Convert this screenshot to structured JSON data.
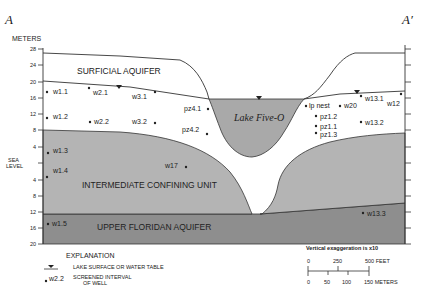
{
  "section": {
    "left_label": "A",
    "right_label": "A′"
  },
  "axis": {
    "title": "METERS",
    "ticks": [
      "28",
      "24",
      "20",
      "16",
      "12",
      "8",
      "4",
      "SEA",
      "4",
      "8",
      "12",
      "16",
      "20"
    ],
    "sea_level_line1": "SEA",
    "sea_level_line2": "LEVEL"
  },
  "units": {
    "surficial": "SURFICIAL AQUIFER",
    "confining": "INTERMEDIATE CONFINING UNIT",
    "floridan": "UPPER FLORIDAN AQUIFER",
    "lake": "Lake Five-O"
  },
  "wells": [
    {
      "id": "w1.1",
      "x": 47,
      "y": 92,
      "lx": 53,
      "ly": 94
    },
    {
      "id": "w1.2",
      "x": 47,
      "y": 118,
      "lx": 53,
      "ly": 119
    },
    {
      "id": "w1.3",
      "x": 48,
      "y": 153,
      "lx": 53,
      "ly": 153
    },
    {
      "id": "w1.4",
      "x": 47,
      "y": 177,
      "lx": 53,
      "ly": 173
    },
    {
      "id": "w1.5",
      "x": 48,
      "y": 224,
      "lx": 52,
      "ly": 226
    },
    {
      "id": "w2.1",
      "x": 89,
      "y": 88,
      "lx": 93,
      "ly": 95
    },
    {
      "id": "w2.2",
      "x": 90,
      "y": 122,
      "lx": 94,
      "ly": 124
    },
    {
      "id": "w3.1",
      "x": 155,
      "y": 92,
      "lx": 132,
      "ly": 99
    },
    {
      "id": "w3.2",
      "x": 155,
      "y": 123,
      "lx": 132,
      "ly": 124
    },
    {
      "id": "pz4.1",
      "x": 208,
      "y": 109,
      "lx": 184,
      "ly": 111
    },
    {
      "id": "pz4.2",
      "x": 207,
      "y": 134,
      "lx": 182,
      "ly": 132
    },
    {
      "id": "w17",
      "x": 186,
      "y": 167,
      "lx": 165,
      "ly": 168
    },
    {
      "id": "lp nest",
      "x": 306,
      "y": 106,
      "lx": 309,
      "ly": 108
    },
    {
      "id": "w20",
      "x": 340,
      "y": 106,
      "lx": 344,
      "ly": 108
    },
    {
      "id": "pz1.2",
      "x": 316,
      "y": 116,
      "lx": 320,
      "ly": 119
    },
    {
      "id": "pz1.1",
      "x": 316,
      "y": 126,
      "lx": 320,
      "ly": 129
    },
    {
      "id": "pz1.3",
      "x": 316,
      "y": 133,
      "lx": 320,
      "ly": 137
    },
    {
      "id": "w13.1",
      "x": 361,
      "y": 96,
      "lx": 365,
      "ly": 101
    },
    {
      "id": "w12",
      "x": 401,
      "y": 94,
      "lx": 387,
      "ly": 106
    },
    {
      "id": "w13.2",
      "x": 361,
      "y": 122,
      "lx": 365,
      "ly": 125
    },
    {
      "id": "w13.3",
      "x": 363,
      "y": 213,
      "lx": 367,
      "ly": 216
    }
  ],
  "scale": {
    "note": "Vertical exaggeration is x10",
    "feet_labels": [
      "0",
      "250",
      "500 FEET"
    ],
    "meter_labels": [
      "0",
      "50",
      "100",
      "150 METERS"
    ]
  },
  "explanation": {
    "title": "EXPLANATION",
    "water_table": "LAKE SURFACE OR WATER TABLE",
    "well_example": "w2.2",
    "well_desc_1": "SCREENED INTERVAL",
    "well_desc_2": "OF WELL"
  },
  "colors": {
    "confining": "#b4b4b4",
    "floridan": "#8e8e8e",
    "lake": "#a9a9a9",
    "line": "#333333"
  }
}
